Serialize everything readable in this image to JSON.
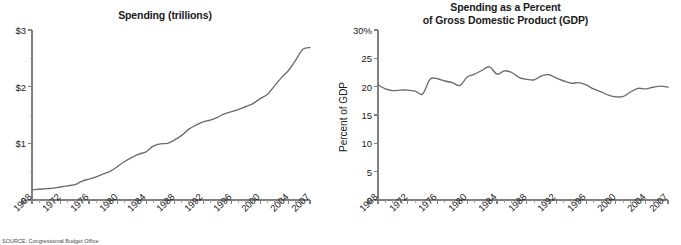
{
  "figure": {
    "background": "#ffffff",
    "line_color": "#6b6b6b",
    "axis_color": "#808080",
    "text_color": "#1a1a1a",
    "source_note": "SOURCE: Congressional Budget Office"
  },
  "chart_data": [
    {
      "type": "line",
      "id": "spending-trillions",
      "title": "Spending (trillions)",
      "xlabel": "",
      "ylabel": "",
      "xlim": [
        1968,
        2007
      ],
      "ylim": [
        0,
        3
      ],
      "grid": false,
      "legend": "none",
      "ytick_labels": [
        "0",
        "$1",
        "$2",
        "$3"
      ],
      "ytick_values": [
        0,
        1,
        2,
        3
      ],
      "yminor_values": [
        0.5,
        1.5,
        2.5
      ],
      "xtick_labels": [
        "1968",
        "1972",
        "1976",
        "1980",
        "1984",
        "1988",
        "1992",
        "1996",
        "2000",
        "2004",
        "2007"
      ],
      "xtick_values": [
        1968,
        1972,
        1976,
        1980,
        1984,
        1988,
        1992,
        1996,
        2000,
        2004,
        2007
      ],
      "x": [
        1968,
        1969,
        1970,
        1971,
        1972,
        1973,
        1974,
        1975,
        1976,
        1977,
        1978,
        1979,
        1980,
        1981,
        1982,
        1983,
        1984,
        1985,
        1986,
        1987,
        1988,
        1989,
        1990,
        1991,
        1992,
        1993,
        1994,
        1995,
        1996,
        1997,
        1998,
        1999,
        2000,
        2001,
        2002,
        2003,
        2004,
        2005,
        2006,
        2007
      ],
      "values": [
        0.18,
        0.19,
        0.2,
        0.21,
        0.23,
        0.25,
        0.27,
        0.33,
        0.37,
        0.41,
        0.46,
        0.51,
        0.59,
        0.68,
        0.75,
        0.81,
        0.85,
        0.95,
        0.99,
        1.0,
        1.06,
        1.14,
        1.25,
        1.32,
        1.38,
        1.41,
        1.46,
        1.52,
        1.56,
        1.6,
        1.65,
        1.7,
        1.79,
        1.86,
        2.01,
        2.16,
        2.29,
        2.47,
        2.66,
        2.69
      ]
    },
    {
      "type": "line",
      "id": "spending-percent-gdp",
      "title": "Spending as a Percent\nof Gross Domestic Product (GDP)",
      "xlabel": "",
      "ylabel": "Percent of GDP",
      "xlim": [
        1968,
        2007
      ],
      "ylim": [
        0,
        30
      ],
      "grid": false,
      "legend": "none",
      "ytick_labels": [
        "0",
        "5",
        "10",
        "15",
        "20",
        "25",
        "30%"
      ],
      "ytick_values": [
        0,
        5,
        10,
        15,
        20,
        25,
        30
      ],
      "xtick_labels": [
        "1968",
        "1972",
        "1976",
        "1980",
        "1984",
        "1988",
        "1992",
        "1996",
        "2000",
        "2004",
        "2007"
      ],
      "xtick_values": [
        1968,
        1972,
        1976,
        1980,
        1984,
        1988,
        1992,
        1996,
        2000,
        2004,
        2007
      ],
      "x": [
        1968,
        1969,
        1970,
        1971,
        1972,
        1973,
        1974,
        1975,
        1976,
        1977,
        1978,
        1979,
        1980,
        1981,
        1982,
        1983,
        1984,
        1985,
        1986,
        1987,
        1988,
        1989,
        1990,
        1991,
        1992,
        1993,
        1994,
        1995,
        1996,
        1997,
        1998,
        1999,
        2000,
        2001,
        2002,
        2003,
        2004,
        2005,
        2006,
        2007
      ],
      "values": [
        20.3,
        19.6,
        19.3,
        19.4,
        19.4,
        19.2,
        18.7,
        21.3,
        21.4,
        21.0,
        20.7,
        20.2,
        21.7,
        22.2,
        22.9,
        23.5,
        22.2,
        22.8,
        22.5,
        21.6,
        21.3,
        21.2,
        21.9,
        22.1,
        21.5,
        21.0,
        20.6,
        20.7,
        20.3,
        19.6,
        19.1,
        18.5,
        18.2,
        18.3,
        19.1,
        19.7,
        19.6,
        19.9,
        20.1,
        19.9
      ]
    }
  ]
}
